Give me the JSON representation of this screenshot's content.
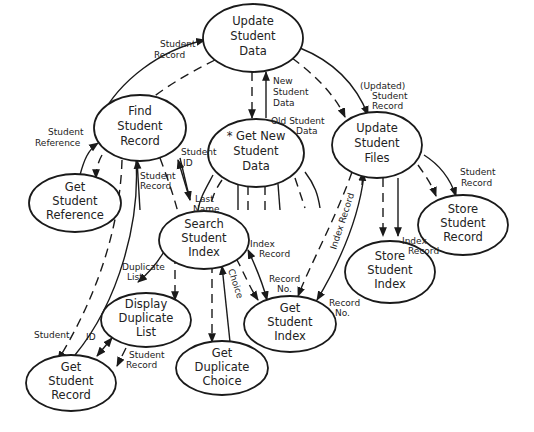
{
  "diagram": {
    "type": "structure-chart / data-flow hierarchy",
    "nodes": [
      {
        "id": "update_student_data",
        "lines": [
          "Update",
          "Student",
          "Data"
        ]
      },
      {
        "id": "find_student_record",
        "lines": [
          "Find",
          "Student",
          "Record"
        ]
      },
      {
        "id": "get_new_student_data",
        "lines": [
          "* Get New",
          "Student",
          "Data"
        ]
      },
      {
        "id": "update_student_files",
        "lines": [
          "Update",
          "Student",
          "Files"
        ]
      },
      {
        "id": "get_student_reference",
        "lines": [
          "Get",
          "Student",
          "Reference"
        ]
      },
      {
        "id": "search_student_index",
        "lines": [
          "Search",
          "Student",
          "Index"
        ]
      },
      {
        "id": "store_student_record",
        "lines": [
          "Store",
          "Student",
          "Record"
        ]
      },
      {
        "id": "store_student_index",
        "lines": [
          "Store",
          "Student",
          "Index"
        ]
      },
      {
        "id": "display_duplicate_list",
        "lines": [
          "Display",
          "Duplicate",
          "List"
        ]
      },
      {
        "id": "get_student_index",
        "lines": [
          "Get",
          "Student",
          "Index"
        ]
      },
      {
        "id": "get_duplicate_choice",
        "lines": [
          "Get",
          "Duplicate",
          "Choice"
        ]
      },
      {
        "id": "get_student_record",
        "lines": [
          "Get",
          "Student",
          "Record"
        ]
      }
    ],
    "flow_labels": [
      {
        "id": "fl_student_record_top",
        "lines": [
          "Student",
          "Record"
        ]
      },
      {
        "id": "fl_new_student_data",
        "lines": [
          "New",
          "Student",
          "Data"
        ]
      },
      {
        "id": "fl_old_student_data",
        "lines": [
          "Old Student",
          "Data"
        ]
      },
      {
        "id": "fl_updated_student_record",
        "lines": [
          "(Updated)",
          "Student",
          "Record"
        ]
      },
      {
        "id": "fl_student_reference",
        "lines": [
          "Student",
          "Reference"
        ]
      },
      {
        "id": "fl_student_id_1",
        "lines": [
          "Student",
          "ID"
        ]
      },
      {
        "id": "fl_student_record_mid",
        "lines": [
          "Student",
          "Record"
        ]
      },
      {
        "id": "fl_last_name",
        "lines": [
          "Last",
          "Name"
        ]
      },
      {
        "id": "fl_student_record_right",
        "lines": [
          "Student",
          "Record"
        ]
      },
      {
        "id": "fl_index_record_diag",
        "lines": [
          "Index Record"
        ]
      },
      {
        "id": "fl_index_record_store",
        "lines": [
          "Index",
          "Record"
        ]
      },
      {
        "id": "fl_index_record_search",
        "lines": [
          "Index",
          "Record"
        ]
      },
      {
        "id": "fl_record_no_1",
        "lines": [
          "Record",
          "No."
        ]
      },
      {
        "id": "fl_record_no_2",
        "lines": [
          "Record",
          "No."
        ]
      },
      {
        "id": "fl_choice",
        "lines": [
          "Choice"
        ]
      },
      {
        "id": "fl_duplicate_list",
        "lines": [
          "Duplicate",
          "List"
        ]
      },
      {
        "id": "fl_student",
        "lines": [
          "Student"
        ]
      },
      {
        "id": "fl_id",
        "lines": [
          "ID"
        ]
      },
      {
        "id": "fl_student_record_bottom",
        "lines": [
          "Student",
          "Record"
        ]
      }
    ]
  }
}
